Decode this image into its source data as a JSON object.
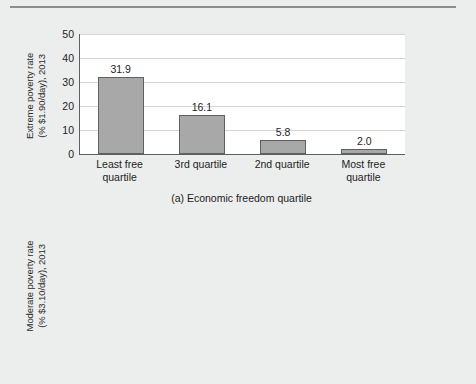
{
  "chart_data": [
    {
      "type": "bar",
      "panel": "(a)",
      "title": "",
      "caption": "(a) Economic freedom quartile",
      "xlabel": "Economic freedom quartile",
      "ylabel": "Extreme poverty rate\n(% $1.90/day), 2013",
      "ylabel_line1": "Extreme poverty rate",
      "ylabel_line2": "(% $1.90/day), 2013",
      "categories": [
        "Least free quartile",
        "3rd quartile",
        "2nd quartile",
        "Most free quartile"
      ],
      "category_lines": [
        [
          "Least free",
          "quartile"
        ],
        [
          "3rd quartile",
          ""
        ],
        [
          "2nd quartile",
          ""
        ],
        [
          "Most free",
          "quartile"
        ]
      ],
      "values": [
        31.9,
        16.1,
        5.8,
        2.0
      ],
      "value_labels": [
        "31.9",
        "16.1",
        "5.8",
        "2.0"
      ],
      "ylim": [
        0,
        50
      ],
      "yticks": [
        0,
        10,
        20,
        30,
        40,
        50
      ],
      "ytick_labels": [
        "0",
        "10",
        "20",
        "30",
        "40",
        "50"
      ],
      "grid": true,
      "legend": "none",
      "bar_color": "#a8a8a8",
      "bar_border_color": "#5f6061"
    },
    {
      "type": "bar",
      "panel": "(b)",
      "title": "",
      "caption": "(b) Economic freedom quartile",
      "xlabel": "Economic freedom quartile",
      "ylabel": "Moderate poverty rate\n(% $3.10/day), 2013",
      "ylabel_line1": "Moderate poverty rate",
      "ylabel_line2": "(% $3.10/day), 2013",
      "categories": [
        "Least free quartile",
        "3rd quartile",
        "2nd quartile",
        "Most free quartile"
      ],
      "category_lines": [
        [
          "Least free",
          "quartile"
        ],
        [
          "3rd quartile",
          ""
        ],
        [
          "2nd quartile",
          ""
        ],
        [
          "Most free",
          "quartile"
        ]
      ],
      "values": [
        49.8,
        29.9,
        14.6,
        3.4
      ],
      "value_labels": [
        "49.8",
        "29.9",
        "14.6",
        "3.4"
      ],
      "ylim": [
        0,
        70
      ],
      "yticks": [
        0,
        10,
        20,
        30,
        40,
        50,
        60,
        70
      ],
      "ytick_labels": [
        "0",
        "10",
        "20",
        "30",
        "40",
        "50",
        "60",
        "70"
      ],
      "grid": true,
      "legend": "none",
      "bar_color": "#a8a8a8",
      "bar_border_color": "#5f6061"
    }
  ],
  "colors": {
    "page_background": "#eceded",
    "plot_background": "#ffffff",
    "axis": "#5d5f60",
    "gridline": "#d3d5d6",
    "rule": "#8b8d8e",
    "text": "#1d1d1d"
  }
}
